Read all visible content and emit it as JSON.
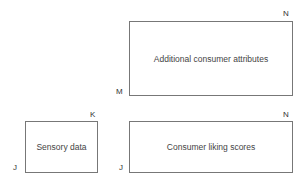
{
  "diagram": {
    "blocks": [
      {
        "id": "additional",
        "label": "Additional consumer attributes",
        "corner_top_right": "N",
        "corner_bottom_left": "M"
      },
      {
        "id": "sensory",
        "label": "Sensory data",
        "corner_top_right": "K",
        "corner_bottom_left": "J"
      },
      {
        "id": "liking",
        "label": "Consumer liking scores",
        "corner_top_right": "N",
        "corner_bottom_left": "J"
      }
    ]
  }
}
